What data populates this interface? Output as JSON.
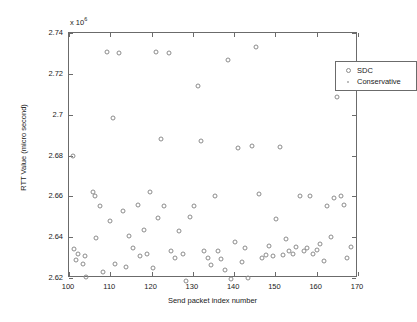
{
  "chart_data": {
    "type": "scatter",
    "title": "",
    "xlabel": "Send packet index number",
    "ylabel": "RTT Value (micro second)",
    "y_multiplier_text": "x 10",
    "y_multiplier_exponent": "6",
    "xlim": [
      100,
      170
    ],
    "ylim": [
      2.62,
      2.74
    ],
    "xticks": [
      100,
      110,
      120,
      130,
      140,
      150,
      160,
      170
    ],
    "xtick_labels": [
      "100",
      "110",
      "120",
      "130",
      "140",
      "150",
      "160",
      "170"
    ],
    "yticks": [
      2.62,
      2.64,
      2.66,
      2.68,
      2.7,
      2.72,
      2.74
    ],
    "ytick_labels": [
      "2.62",
      "2.64",
      "2.66",
      "2.68",
      "2.7",
      "2.72",
      "2.74"
    ],
    "grid": false,
    "legend_position": "upper right",
    "marker_color": "#8c8c8c",
    "axis_color": "#6b6b6b",
    "series": [
      {
        "name": "SDC",
        "marker": "circle",
        "points": [
          [
            101.0,
            2.68
          ],
          [
            101.2,
            2.634
          ],
          [
            101.6,
            2.629
          ],
          [
            102.3,
            2.632
          ],
          [
            103.4,
            2.627
          ],
          [
            103.8,
            2.631
          ],
          [
            104.1,
            2.6207
          ],
          [
            105.8,
            2.662
          ],
          [
            106.3,
            2.66
          ],
          [
            106.6,
            2.6395
          ],
          [
            107.5,
            2.6555
          ],
          [
            108.3,
            2.623
          ],
          [
            109.3,
            2.7305
          ],
          [
            109.9,
            2.648
          ],
          [
            110.6,
            2.6985
          ],
          [
            111.2,
            2.627
          ],
          [
            112.2,
            2.73
          ],
          [
            113.0,
            2.653
          ],
          [
            113.7,
            2.6255
          ],
          [
            114.5,
            2.6405
          ],
          [
            115.6,
            2.6345
          ],
          [
            116.6,
            2.656
          ],
          [
            117.2,
            2.631
          ],
          [
            118.1,
            2.6435
          ],
          [
            118.9,
            2.632
          ],
          [
            119.7,
            2.662
          ],
          [
            120.3,
            2.625
          ],
          [
            121.0,
            2.7305
          ],
          [
            121.5,
            2.6495
          ],
          [
            122.3,
            2.688
          ],
          [
            123.0,
            2.6555
          ],
          [
            124.2,
            2.73
          ],
          [
            124.8,
            2.633
          ],
          [
            125.7,
            2.63
          ],
          [
            126.6,
            2.643
          ],
          [
            127.5,
            2.632
          ],
          [
            128.3,
            2.6185
          ],
          [
            129.4,
            2.65
          ],
          [
            130.3,
            2.6555
          ],
          [
            131.2,
            2.714
          ],
          [
            132.0,
            2.687
          ],
          [
            132.8,
            2.633
          ],
          [
            133.6,
            2.63
          ],
          [
            134.5,
            2.6265
          ],
          [
            135.4,
            2.66
          ],
          [
            136.0,
            2.633
          ],
          [
            136.9,
            2.6295
          ],
          [
            137.7,
            2.624
          ],
          [
            138.6,
            2.727
          ],
          [
            139.3,
            2.6195
          ],
          [
            140.2,
            2.6375
          ],
          [
            141.0,
            2.6835
          ],
          [
            141.8,
            2.628
          ],
          [
            142.6,
            2.6345
          ],
          [
            143.4,
            2.62
          ],
          [
            144.3,
            2.6845
          ],
          [
            145.2,
            2.733
          ],
          [
            146.0,
            2.661
          ],
          [
            146.8,
            2.63
          ],
          [
            147.6,
            2.6315
          ],
          [
            148.5,
            2.6355
          ],
          [
            149.3,
            2.631
          ],
          [
            150.1,
            2.649
          ],
          [
            151.0,
            2.684
          ],
          [
            151.8,
            2.6315
          ],
          [
            152.6,
            2.639
          ],
          [
            153.4,
            2.633
          ],
          [
            154.3,
            2.632
          ],
          [
            155.1,
            2.635
          ],
          [
            156.0,
            2.66
          ],
          [
            156.8,
            2.633
          ],
          [
            157.6,
            2.6345
          ],
          [
            158.4,
            2.66
          ],
          [
            159.2,
            2.632
          ],
          [
            160.1,
            2.6335
          ],
          [
            160.9,
            2.6365
          ],
          [
            161.7,
            2.6285
          ],
          [
            162.6,
            2.6555
          ],
          [
            163.4,
            2.64
          ],
          [
            164.2,
            2.659
          ],
          [
            165.0,
            2.7085
          ],
          [
            165.8,
            2.66
          ],
          [
            166.6,
            2.656
          ],
          [
            167.4,
            2.63
          ],
          [
            168.2,
            2.635
          ]
        ]
      },
      {
        "name": "Conservative",
        "marker": "dot",
        "points": []
      }
    ]
  },
  "legend": {
    "items": [
      {
        "label": "SDC"
      },
      {
        "label": "Conservative"
      }
    ]
  }
}
